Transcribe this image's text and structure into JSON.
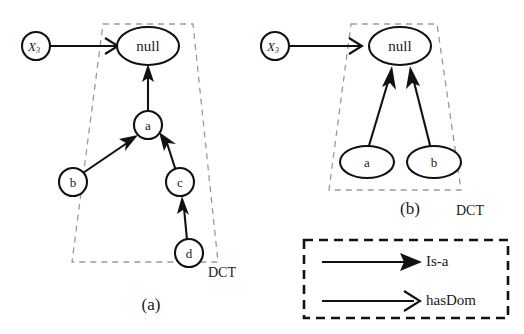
{
  "figure": {
    "colors": {
      "ink": "#111111",
      "boundary": "#9a9a9a",
      "background": "#ffffff"
    },
    "panels": [
      {
        "id": "panel-a",
        "caption": "(a)",
        "group_label": "DCT",
        "external_node": {
          "label": "X",
          "subscript": "3"
        },
        "nodes": [
          {
            "id": "null",
            "label": "null",
            "shape": "ellipse"
          },
          {
            "id": "a",
            "label": "a",
            "shape": "circle"
          },
          {
            "id": "b",
            "label": "b",
            "shape": "circle"
          },
          {
            "id": "c",
            "label": "c",
            "shape": "circle"
          },
          {
            "id": "d",
            "label": "d",
            "shape": "circle"
          }
        ],
        "edges": [
          {
            "from": "X",
            "to": "null",
            "type": "hasDom"
          },
          {
            "from": "a",
            "to": "null",
            "type": "Is-a"
          },
          {
            "from": "b",
            "to": "a",
            "type": "Is-a"
          },
          {
            "from": "c",
            "to": "a",
            "type": "Is-a"
          },
          {
            "from": "d",
            "to": "c",
            "type": "Is-a"
          }
        ]
      },
      {
        "id": "panel-b",
        "caption": "(b)",
        "group_label": "DCT",
        "external_node": {
          "label": "X",
          "subscript": "3"
        },
        "nodes": [
          {
            "id": "null",
            "label": "null",
            "shape": "ellipse"
          },
          {
            "id": "a",
            "label": "a",
            "shape": "ellipse"
          },
          {
            "id": "b",
            "label": "b",
            "shape": "ellipse"
          }
        ],
        "edges": [
          {
            "from": "X",
            "to": "null",
            "type": "hasDom"
          },
          {
            "from": "a",
            "to": "null",
            "type": "Is-a"
          },
          {
            "from": "b",
            "to": "null",
            "type": "Is-a"
          }
        ]
      }
    ],
    "legend": {
      "entries": [
        {
          "id": "is-a",
          "label": "Is-a",
          "arrowhead": "solid"
        },
        {
          "id": "has-dom",
          "label": "hasDom",
          "arrowhead": "open"
        }
      ]
    }
  }
}
